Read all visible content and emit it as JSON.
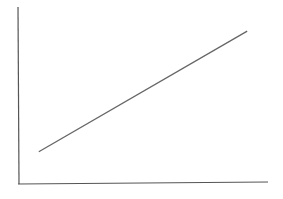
{
  "chart_data": {
    "type": "line",
    "title": "",
    "xlabel": "",
    "ylabel": "",
    "grid": false,
    "legend": null,
    "series": [
      {
        "name": "",
        "x": [
          0,
          1
        ],
        "values": [
          0.15,
          0.9
        ]
      }
    ],
    "xlim": [
      -0.1,
      1.1
    ],
    "ylim": [
      -0.05,
      1.05
    ]
  },
  "colors": {
    "axis": "#555555",
    "line": "#666666",
    "background": "#ffffff"
  }
}
